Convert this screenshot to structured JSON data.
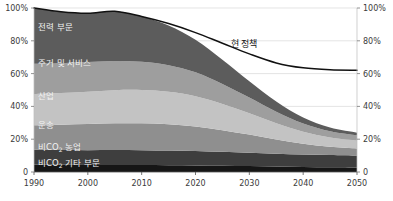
{
  "chart_data": {
    "type": "area",
    "title": "",
    "subtitle": "",
    "xlabel": "",
    "ylabel": "",
    "stacked": true,
    "grid": true,
    "legend_position": "inline-on-bands",
    "x": [
      1990,
      1995,
      2000,
      2005,
      2010,
      2015,
      2020,
      2025,
      2030,
      2035,
      2040,
      2045,
      2050
    ],
    "xlim": [
      1990,
      2050
    ],
    "ylim": [
      0,
      100
    ],
    "x_tick_labels": [
      "1990",
      "2000",
      "2010",
      "2020",
      "2030",
      "2040",
      "2050"
    ],
    "x_ticks": [
      1990,
      2000,
      2010,
      2020,
      2030,
      2040,
      2050
    ],
    "y_ticks": [
      0,
      20,
      40,
      60,
      80,
      100
    ],
    "y_tick_labels_left": [
      "0",
      "20%",
      "40%",
      "60%",
      "80%",
      "100%"
    ],
    "y_tick_labels_right": [
      "0",
      "20%",
      "40%",
      "60%",
      "80%",
      "100%"
    ],
    "series": [
      {
        "name": "비CO₂ 기타 부문",
        "name_base": "비CO",
        "name_sub": "2",
        "name_tail": " 기타 부문",
        "color": "#161616",
        "label_color": "#f0f0f0",
        "values": [
          4.5,
          4.4,
          4.3,
          4.3,
          4.2,
          4.1,
          4.0,
          3.8,
          3.6,
          3.3,
          3.1,
          2.9,
          2.8
        ]
      },
      {
        "name": "비CO₂ 농업",
        "name_base": "비CO",
        "name_sub": "2",
        "name_tail": " 농업",
        "color": "#3e3e3e",
        "label_color": "#f0f0f0",
        "values": [
          9.0,
          9.0,
          9.0,
          9.1,
          9.1,
          9.0,
          8.8,
          8.5,
          8.2,
          7.9,
          7.6,
          7.4,
          7.2
        ]
      },
      {
        "name": "운송",
        "name_base": "운송",
        "name_sub": "",
        "name_tail": "",
        "color": "#8f8f8f",
        "label_color": "#1c1c1c",
        "values": [
          15.0,
          15.4,
          15.9,
          16.3,
          16.4,
          16.0,
          15.0,
          13.2,
          11.0,
          8.6,
          6.5,
          5.1,
          4.4
        ]
      },
      {
        "name": "산업",
        "name_base": "산업",
        "name_sub": "",
        "name_tail": "",
        "color": "#c3c3c3",
        "label_color": "#1c1c1c",
        "values": [
          19.0,
          19.3,
          19.8,
          20.2,
          20.3,
          19.8,
          18.4,
          16.0,
          13.0,
          10.0,
          7.4,
          5.7,
          4.8
        ]
      },
      {
        "name": "주거 및 서비스",
        "name_base": "주거 및 서비스",
        "name_sub": "",
        "name_tail": "",
        "color": "#9e9e9e",
        "label_color": "#f5f5f5",
        "values": [
          18.5,
          18.2,
          18.0,
          17.8,
          17.2,
          16.2,
          14.6,
          12.2,
          9.6,
          7.0,
          5.0,
          3.8,
          3.2
        ]
      },
      {
        "name": "전력 부문",
        "name_base": "전력 부문",
        "name_sub": "",
        "name_tail": "",
        "color": "#5c5c5c",
        "label_color": "#f0f0f0",
        "values": [
          34.0,
          31.4,
          29.8,
          30.3,
          27.6,
          24.2,
          19.8,
          14.8,
          10.0,
          6.2,
          3.6,
          2.2,
          1.6
        ]
      }
    ],
    "total_stack": [
      100.0,
      97.7,
      96.8,
      98.0,
      94.8,
      89.3,
      80.6,
      68.5,
      55.4,
      43.0,
      33.2,
      27.1,
      24.0
    ],
    "line_series": {
      "name": "현 정책",
      "color": "#111111",
      "values": [
        100.0,
        97.7,
        96.8,
        98.0,
        94.8,
        90.5,
        85.0,
        78.5,
        72.0,
        66.5,
        63.5,
        62.3,
        62.0
      ],
      "label": "현 정책",
      "label_x": 2029,
      "label_y": 76
    }
  },
  "axes": {
    "left_labels": [
      "100%",
      "80%",
      "60%",
      "40%",
      "20%",
      "0"
    ],
    "right_labels": [
      "100%",
      "80%",
      "60%",
      "40%",
      "20%",
      "0"
    ],
    "x_labels": [
      "1990",
      "2000",
      "2010",
      "2020",
      "2030",
      "2040",
      "2050"
    ]
  }
}
